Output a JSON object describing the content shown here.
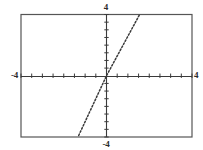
{
  "figure": {
    "background_color": "#ffffff",
    "frame_color": "#555555",
    "axis_color": "#3a3a3a",
    "curve_color": "#3a3a3a",
    "label_color": "#2b2b2b"
  },
  "labels": {
    "y_max": "4",
    "y_min": "-4",
    "x_min": "-4",
    "x_max": "4"
  },
  "chart_data": {
    "type": "line",
    "title": "",
    "xlabel": "",
    "ylabel": "",
    "xlim": [
      -4,
      4
    ],
    "ylim": [
      -4,
      4
    ],
    "xticks": [
      -4,
      -3.5,
      -3,
      -2.5,
      -2,
      -1.5,
      -1,
      -0.5,
      0,
      0.5,
      1,
      1.5,
      2,
      2.5,
      3,
      3.5,
      4
    ],
    "yticks": [
      -4,
      -3.5,
      -3,
      -2.5,
      -2,
      -1.5,
      -1,
      -0.5,
      0,
      0.5,
      1,
      1.5,
      2,
      2.5,
      3,
      3.5,
      4
    ],
    "xtick_labels": [
      "-4",
      "4"
    ],
    "ytick_labels": [
      "-4",
      "4"
    ],
    "grid": false,
    "legend": false,
    "legend_position": "none",
    "axes_style": "centered-cross",
    "series": [
      {
        "name": "y = 2.7x",
        "style": "dotted",
        "slope": 2.7,
        "intercept": 0,
        "x": [
          -1.3,
          0,
          1.55
        ],
        "y": [
          -3.9,
          0,
          4.0
        ]
      }
    ]
  }
}
